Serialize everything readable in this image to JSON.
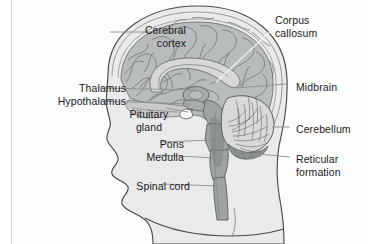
{
  "figure": {
    "kind": "anatomical-diagram",
    "background_color": "#ffffff",
    "panel_color": "#fdfdfd",
    "head_fill": "#e9eaea",
    "head_outline": "#4a4a4a",
    "skull_fill": "#f1f1f1",
    "cortex_fill": "#b9bcbc",
    "cortex_outline": "#6e7272",
    "deep_structure_fill": "#a8acac",
    "brainstem_fill": "#9fa3a3",
    "cerebellum_fill": "#d8dada",
    "cerebellum_outline": "#5d6161",
    "pituitary_fill": "#f8f8f8",
    "leader_color": "#8d8d8d",
    "leader_light_color": "#f2f2f2",
    "border_color": "#d6d6d6",
    "text_color": "#1b1b1b"
  },
  "labels": [
    {
      "id": "cerebral-cortex",
      "text": "Cerebral\ncortex",
      "align": "right",
      "x": 94,
      "y": 24,
      "width": 92
    },
    {
      "id": "thalamus",
      "text": "Thalamus",
      "align": "right",
      "x": 34,
      "y": 82,
      "width": 92
    },
    {
      "id": "hypothalamus",
      "text": "Hypothalamus",
      "align": "right",
      "x": 14,
      "y": 95,
      "width": 112
    },
    {
      "id": "pituitary-gland",
      "text": "Pituitary\ngland",
      "align": "center",
      "x": 118,
      "y": 108,
      "width": 62
    },
    {
      "id": "pons",
      "text": "Pons",
      "align": "right",
      "x": 118,
      "y": 138,
      "width": 66
    },
    {
      "id": "medulla",
      "text": "Medulla",
      "align": "right",
      "x": 110,
      "y": 151,
      "width": 74
    },
    {
      "id": "spinal-cord",
      "text": "Spinal cord",
      "align": "right",
      "x": 100,
      "y": 180,
      "width": 90
    },
    {
      "id": "corpus-callosum",
      "text": "Corpus\ncallosum",
      "align": "left",
      "x": 275,
      "y": 14,
      "width": 86
    },
    {
      "id": "midbrain",
      "text": "Midbrain",
      "align": "left",
      "x": 296,
      "y": 81,
      "width": 70
    },
    {
      "id": "cerebellum",
      "text": "Cerebellum",
      "align": "left",
      "x": 296,
      "y": 123,
      "width": 72
    },
    {
      "id": "reticular-formation",
      "text": "Reticular\nformation",
      "align": "left",
      "x": 296,
      "y": 153,
      "width": 72
    }
  ],
  "structures": [
    {
      "id": "head-profile",
      "name": "Head profile (midsagittal)"
    },
    {
      "id": "skull",
      "name": "Skull / cranial vault"
    },
    {
      "id": "cerebral-cortex",
      "name": "Cerebral cortex"
    },
    {
      "id": "corpus-callosum",
      "name": "Corpus callosum"
    },
    {
      "id": "thalamus",
      "name": "Thalamus"
    },
    {
      "id": "hypothalamus",
      "name": "Hypothalamus"
    },
    {
      "id": "pituitary-gland",
      "name": "Pituitary gland"
    },
    {
      "id": "midbrain",
      "name": "Midbrain"
    },
    {
      "id": "pons",
      "name": "Pons"
    },
    {
      "id": "medulla",
      "name": "Medulla oblongata"
    },
    {
      "id": "cerebellum",
      "name": "Cerebellum"
    },
    {
      "id": "reticular-formation",
      "name": "Reticular formation"
    },
    {
      "id": "spinal-cord",
      "name": "Spinal cord"
    }
  ]
}
